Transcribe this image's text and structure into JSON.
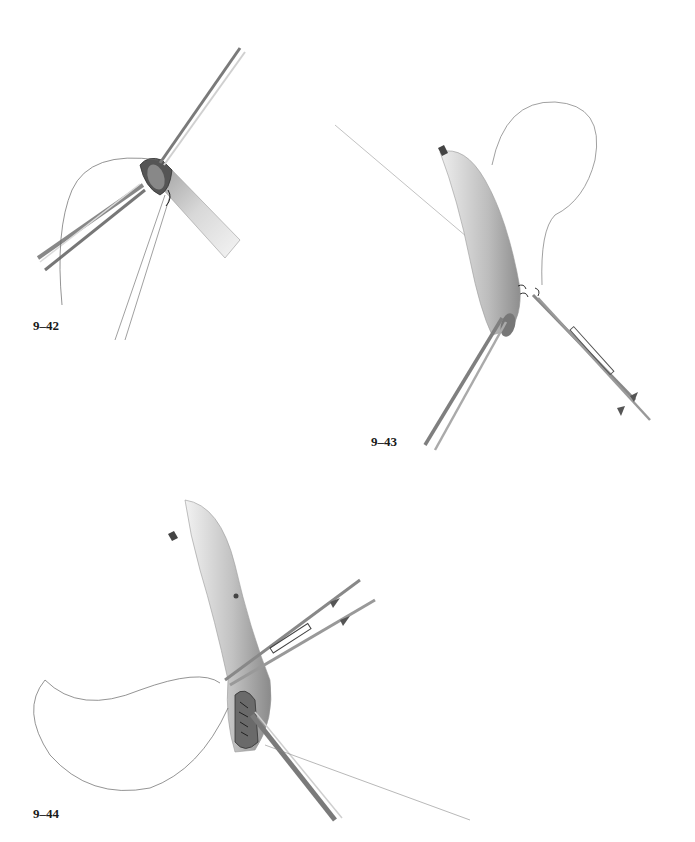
{
  "figures": [
    {
      "id": "fig-9-42",
      "label": "9–42",
      "description": "Vessel end held open with forceps while first suture is placed"
    },
    {
      "id": "fig-9-43",
      "label": "9–43",
      "description": "Graft vessel with continuous suture loop, needle holder and forceps at heel"
    },
    {
      "id": "fig-9-44",
      "label": "9–44",
      "description": "Completion of anastomosis with needle holder and forceps, suture loop"
    }
  ],
  "colors": {
    "background": "#ffffff",
    "vessel_shade": "#b8b8b8",
    "vessel_light": "#e6e6e6",
    "instrument": "#8a8a8a",
    "suture": "#555555",
    "label": "#1a1a1a"
  }
}
